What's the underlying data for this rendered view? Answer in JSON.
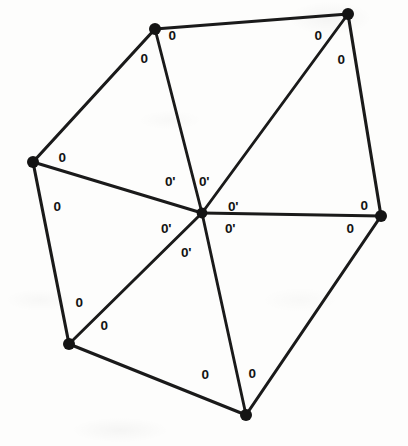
{
  "figure": {
    "kind": "geometry-diagram",
    "background_color": "#fdfdfc",
    "ink_color": "#141414",
    "canvas": {
      "width": 408,
      "height": 446
    }
  },
  "chart_data": {
    "type": "diagram",
    "title": "",
    "vertices": [
      {
        "id": "V1",
        "name": "top-left-vertex",
        "x": 155,
        "y": 29
      },
      {
        "id": "V2",
        "name": "top-right-vertex",
        "x": 348,
        "y": 14
      },
      {
        "id": "V3",
        "name": "right-vertex",
        "x": 381,
        "y": 216
      },
      {
        "id": "V4",
        "name": "bottom-vertex",
        "x": 246,
        "y": 415
      },
      {
        "id": "V5",
        "name": "bottom-left-vertex",
        "x": 69,
        "y": 344
      },
      {
        "id": "V6",
        "name": "left-vertex",
        "x": 33,
        "y": 162
      },
      {
        "id": "C",
        "name": "center-vertex",
        "x": 202,
        "y": 213
      }
    ],
    "perimeter_edges": [
      {
        "from": "V1",
        "to": "V2"
      },
      {
        "from": "V2",
        "to": "V3"
      },
      {
        "from": "V3",
        "to": "V4"
      },
      {
        "from": "V4",
        "to": "V5"
      },
      {
        "from": "V5",
        "to": "V6"
      },
      {
        "from": "V6",
        "to": "V1"
      }
    ],
    "spoke_edges": [
      {
        "from": "C",
        "to": "V1"
      },
      {
        "from": "C",
        "to": "V2"
      },
      {
        "from": "C",
        "to": "V3"
      },
      {
        "from": "C",
        "to": "V4"
      },
      {
        "from": "C",
        "to": "V5"
      },
      {
        "from": "C",
        "to": "V6"
      }
    ],
    "labels": [
      {
        "id": "L01",
        "text": "0",
        "x": 172,
        "y": 36,
        "at": "V1",
        "kind": "theta"
      },
      {
        "id": "L02",
        "text": "0",
        "x": 144,
        "y": 59,
        "at": "V1",
        "kind": "theta"
      },
      {
        "id": "L03",
        "text": "0",
        "x": 318,
        "y": 36,
        "at": "V2",
        "kind": "theta"
      },
      {
        "id": "L04",
        "text": "0",
        "x": 341,
        "y": 60,
        "at": "V2",
        "kind": "theta"
      },
      {
        "id": "L05",
        "text": "0",
        "x": 364,
        "y": 206,
        "at": "V3",
        "kind": "theta"
      },
      {
        "id": "L06",
        "text": "0",
        "x": 350,
        "y": 229,
        "at": "V3",
        "kind": "theta"
      },
      {
        "id": "L07",
        "text": "0",
        "x": 205,
        "y": 375,
        "at": "V4",
        "kind": "theta"
      },
      {
        "id": "L08",
        "text": "0",
        "x": 252,
        "y": 374,
        "at": "V4",
        "kind": "theta"
      },
      {
        "id": "L09",
        "text": "0",
        "x": 79,
        "y": 303,
        "at": "V5",
        "kind": "theta"
      },
      {
        "id": "L10",
        "text": "0",
        "x": 104,
        "y": 326,
        "at": "V5",
        "kind": "theta"
      },
      {
        "id": "L11",
        "text": "0",
        "x": 62,
        "y": 158,
        "at": "V6",
        "kind": "theta"
      },
      {
        "id": "L12",
        "text": "0",
        "x": 57,
        "y": 207,
        "at": "V6",
        "kind": "theta"
      },
      {
        "id": "L13",
        "text": "0'",
        "x": 170,
        "y": 182,
        "at": "C",
        "kind": "theta-prime"
      },
      {
        "id": "L14",
        "text": "0'",
        "x": 204,
        "y": 182,
        "at": "C",
        "kind": "theta-prime"
      },
      {
        "id": "L15",
        "text": "0'",
        "x": 233,
        "y": 207,
        "at": "C",
        "kind": "theta-prime"
      },
      {
        "id": "L16",
        "text": "0'",
        "x": 230,
        "y": 229,
        "at": "C",
        "kind": "theta-prime"
      },
      {
        "id": "L17",
        "text": "0'",
        "x": 166,
        "y": 229,
        "at": "C",
        "kind": "theta-prime"
      },
      {
        "id": "L18",
        "text": "0'",
        "x": 186,
        "y": 253,
        "at": "C",
        "kind": "theta-prime"
      }
    ],
    "legend": [],
    "grid": false
  }
}
